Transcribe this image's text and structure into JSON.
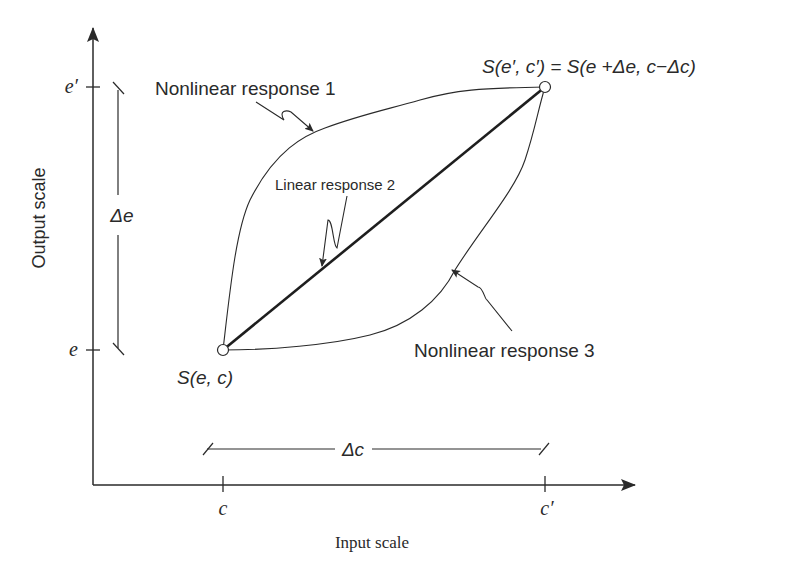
{
  "figure": {
    "axes": {
      "x_label": "Input scale",
      "y_label": "Output scale",
      "x_ticks": [
        {
          "label": "c",
          "x": 223
        },
        {
          "label": "c′",
          "x": 545
        }
      ],
      "y_ticks": [
        {
          "label": "e′",
          "y": 87
        },
        {
          "label": "e",
          "y": 350
        }
      ]
    },
    "dimensions": {
      "delta_e": "Δe",
      "delta_c": "Δc"
    },
    "points": {
      "start": "S(e, c)",
      "end": "S(e′, c′) = S(e +Δe, c−Δc)"
    },
    "curves": {
      "nonlinear_1": "Nonlinear response 1",
      "linear_2": "Linear response 2",
      "nonlinear_3": "Nonlinear response 3"
    },
    "colors": {
      "ink": "#2a2a2a",
      "background": "#ffffff"
    }
  }
}
